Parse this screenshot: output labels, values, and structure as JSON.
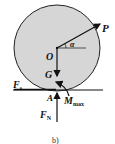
{
  "diagram": {
    "caption": "b)",
    "colors": {
      "wheel_fill": "#d6d6d6",
      "wheel_stroke": "#222222",
      "line": "#111111"
    },
    "labels": {
      "force_p": "P",
      "angle": "α",
      "center": "O",
      "gravity": "G",
      "friction": "F",
      "friction_sub": "s",
      "contact_point": "A",
      "normal": "F",
      "normal_sub": "N",
      "moment": "M",
      "moment_sub": "max"
    }
  }
}
